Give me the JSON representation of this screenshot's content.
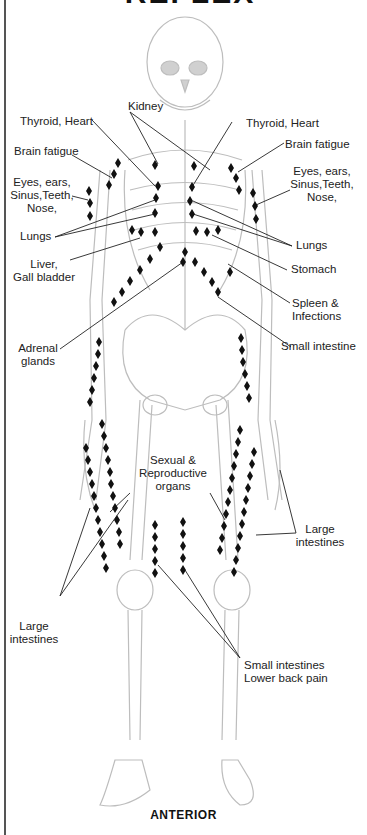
{
  "diagram": {
    "title_partial": "REFLEX POINTS",
    "caption": "ANTERIOR",
    "colors": {
      "marker": "#111111",
      "bone_outline": "#bdbdbd",
      "leader_line": "#222222",
      "border": "#555555"
    },
    "labels": {
      "kidney": "Kidney",
      "thyroid_heart_left": "Thyroid, Heart",
      "thyroid_heart_right": "Thyroid, Heart",
      "brain_fatigue_left": "Brain fatigue",
      "brain_fatigue_right": "Brain fatigue",
      "eyes_left": [
        "Eyes, ears,",
        "Sinus,Teeth,",
        "Nose,"
      ],
      "eyes_right": [
        "Eyes, ears,",
        "Sinus,Teeth,",
        "Nose,"
      ],
      "lungs_left": "Lungs",
      "lungs_right": "Lungs",
      "liver": [
        "Liver,",
        "Gall bladder"
      ],
      "stomach": "Stomach",
      "spleen": [
        "Spleen &",
        "Infections"
      ],
      "small_intestine": "Small intestine",
      "adrenal": [
        "Adrenal",
        "glands"
      ],
      "sexual": [
        "Sexual &",
        "Reproductive",
        "organs"
      ],
      "large_intestines_right": [
        "Large",
        "intestines"
      ],
      "large_intestines_left": [
        "Large",
        "intestines"
      ],
      "small_intestines_lower_back": [
        "Small intestines",
        "Lower back pain"
      ]
    }
  }
}
